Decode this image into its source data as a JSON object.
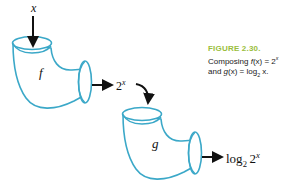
{
  "figure": {
    "background_color": "#ffffff",
    "pipe_stroke_color": "#3BA8C8",
    "pipe_fill_color": "#ffffff",
    "arrow_color": "#111111",
    "caption_accent_color": "#9ABE3C"
  },
  "labels": {
    "input_x": "x",
    "function_f": "f",
    "function_g": "g",
    "intermediate_base": "2",
    "intermediate_exponent": "x",
    "output_log": "log",
    "output_log_base": "2",
    "output_arg_base": "2",
    "output_arg_exponent": "x"
  },
  "caption": {
    "title": "FIGURE 2.30.",
    "line1_pre": "Composing ",
    "line1_fn": "f",
    "line1_mid": "(x) = 2",
    "line1_sup": "x",
    "line2_pre": "and ",
    "line2_fn": "g",
    "line2_mid": "(x) = log",
    "line2_sub": "2",
    "line2_post": " x."
  },
  "icons": {
    "arrow_down_input": "arrow-down-icon",
    "arrow_right_f_output": "arrow-right-icon",
    "arrow_curved_into_g": "curved-arrow-icon",
    "arrow_right_g_output": "arrow-right-icon"
  }
}
